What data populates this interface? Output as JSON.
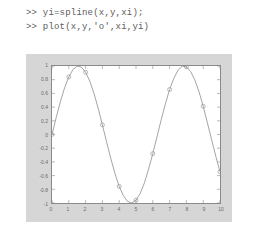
{
  "console": {
    "lines": [
      ">> yi=spline(x,y,xi);",
      ">> plot(x,y,'o',xi,yi)"
    ]
  },
  "figure": {
    "panel_color": "#d6d6d6",
    "axes_color": "#8a8a8a",
    "curve_color": "#9a9a9a",
    "marker_color": "#9a9a9a",
    "label_color": "#6b6b6b"
  },
  "chart_data": {
    "type": "line",
    "title": "",
    "xlabel": "",
    "ylabel": "",
    "xlim": [
      0,
      10
    ],
    "ylim": [
      -1,
      1
    ],
    "grid": false,
    "legend": null,
    "xticks": [
      0,
      1,
      2,
      3,
      4,
      5,
      6,
      7,
      8,
      9,
      10
    ],
    "xtick_labels": [
      "0",
      "1",
      "2",
      "3",
      "4",
      "5",
      "6",
      "7",
      "8",
      "9",
      "10"
    ],
    "yticks": [
      -1,
      -0.8,
      -0.6,
      -0.4,
      -0.2,
      0,
      0.2,
      0.4,
      0.6,
      0.8,
      1
    ],
    "ytick_labels": [
      "-1",
      "-0.8",
      "-0.6",
      "-0.4",
      "-0.2",
      "0",
      "0.2",
      "0.4",
      "0.6",
      "0.8",
      "1"
    ],
    "series": [
      {
        "name": "y (data points)",
        "style": "o",
        "marker": "circle",
        "x": [
          0,
          1,
          2,
          3,
          4,
          5,
          6,
          7,
          8,
          9,
          10
        ],
        "values": [
          0,
          0.841,
          0.909,
          0.141,
          -0.757,
          -0.959,
          -0.279,
          0.657,
          0.989,
          0.412,
          -0.544
        ]
      },
      {
        "name": "yi (spline interpolation)",
        "style": "-",
        "marker": "none",
        "x": [
          0,
          0.25,
          0.5,
          0.75,
          1,
          1.25,
          1.5,
          1.75,
          2,
          2.25,
          2.5,
          2.75,
          3,
          3.25,
          3.5,
          3.75,
          4,
          4.25,
          4.5,
          4.75,
          5,
          5.25,
          5.5,
          5.75,
          6,
          6.25,
          6.5,
          6.75,
          7,
          7.25,
          7.5,
          7.75,
          8,
          8.25,
          8.5,
          8.75,
          9,
          9.25,
          9.5,
          9.75,
          10
        ],
        "values": [
          0,
          0.247,
          0.479,
          0.682,
          0.841,
          0.949,
          0.997,
          0.984,
          0.909,
          0.778,
          0.599,
          0.382,
          0.141,
          -0.108,
          -0.351,
          -0.572,
          -0.757,
          -0.894,
          -0.978,
          -0.999,
          -0.959,
          -0.861,
          -0.706,
          -0.503,
          -0.279,
          -0.033,
          0.215,
          0.447,
          0.657,
          0.82,
          0.938,
          0.996,
          0.989,
          0.92,
          0.798,
          0.625,
          0.412,
          0.171,
          -0.075,
          -0.318,
          -0.544
        ]
      }
    ]
  }
}
